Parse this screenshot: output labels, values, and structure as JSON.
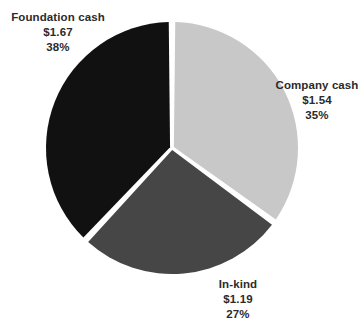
{
  "chart_data": {
    "type": "pie",
    "title": "",
    "subtitle": "",
    "xlabel": "",
    "ylabel": "",
    "legend_position": "none",
    "grid": false,
    "value_prefix": "$",
    "total_value": 4.4,
    "start_angle_deg": 0,
    "direction": "clockwise",
    "categories": [
      "Company cash",
      "In-kind",
      "Foundation cash"
    ],
    "values": [
      1.54,
      1.19,
      1.67
    ],
    "percents": [
      35,
      27,
      38
    ],
    "colors": [
      "#c8c8c8",
      "#464646",
      "#111111"
    ],
    "slices": [
      {
        "name": "Company cash",
        "value": 1.54,
        "value_label": "$1.54",
        "percent": 35,
        "percent_label": "35%",
        "color": "#c8c8c8",
        "start_deg": 0,
        "end_deg": 126
      },
      {
        "name": "In-kind",
        "value": 1.19,
        "value_label": "$1.19",
        "percent": 27,
        "percent_label": "27%",
        "color": "#464646",
        "start_deg": 126,
        "end_deg": 223.2
      },
      {
        "name": "Foundation cash",
        "value": 1.67,
        "value_label": "$1.67",
        "percent": 38,
        "percent_label": "38%",
        "color": "#111111",
        "start_deg": 223.2,
        "end_deg": 360
      }
    ]
  },
  "labels": {
    "foundation_cash": {
      "name": "Foundation cash",
      "value": "$1.67",
      "percent": "38%"
    },
    "company_cash": {
      "name": "Company cash",
      "value": "$1.54",
      "percent": "35%"
    },
    "in_kind": {
      "name": "In-kind",
      "value": "$1.19",
      "percent": "27%"
    }
  }
}
